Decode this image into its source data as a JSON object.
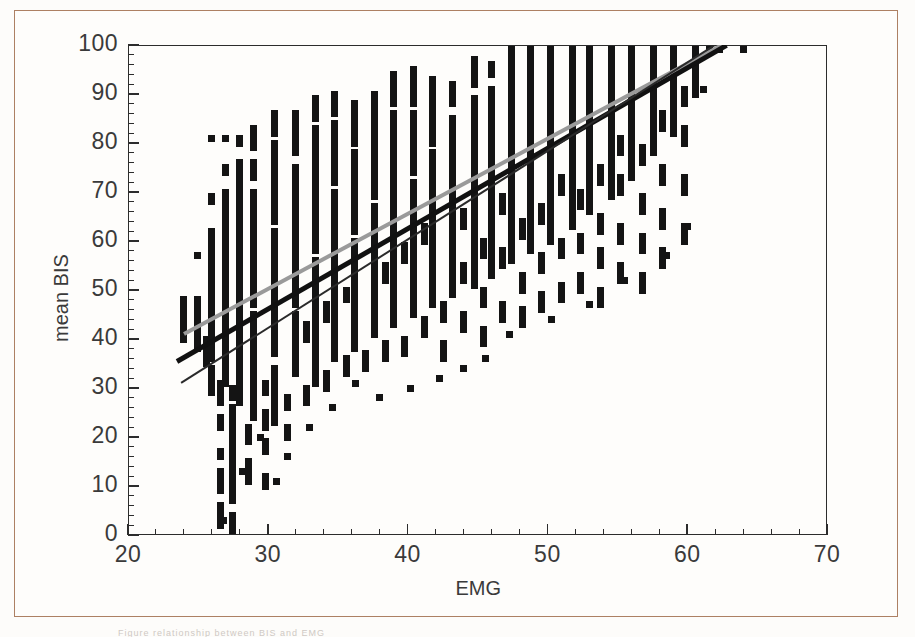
{
  "figure": {
    "frame_color": "#ad8063",
    "background_color": "#fefdfb",
    "caption_fragment": "Figure  relationship    between         BIS          and    EMG"
  },
  "chart_data": {
    "type": "scatter",
    "title": "",
    "xlabel": "EMG",
    "ylabel": "mean BIS",
    "xlim": [
      20,
      70
    ],
    "ylim": [
      0,
      100
    ],
    "x_major_ticks": [
      20,
      30,
      40,
      50,
      60,
      70
    ],
    "y_major_ticks": [
      0,
      10,
      20,
      30,
      40,
      50,
      60,
      70,
      80,
      90,
      100
    ],
    "x_tick_labels": [
      "20",
      "30",
      "40",
      "50",
      "60",
      "70"
    ],
    "y_tick_labels": [
      "0",
      "10",
      "20",
      "30",
      "40",
      "50",
      "60",
      "70",
      "80",
      "90",
      "100"
    ],
    "x_minor_step": 2,
    "y_minor_step": 2,
    "grid": false,
    "legend": "none",
    "marker_color": "#141414",
    "marker_shape": "square",
    "columns": [
      {
        "x": 24.0,
        "bands": [
          [
            40,
            48
          ]
        ]
      },
      {
        "x": 25.0,
        "bands": [
          [
            38,
            48
          ],
          [
            57,
            57
          ]
        ]
      },
      {
        "x": 25.6,
        "bands": [
          [
            35,
            40
          ]
        ]
      },
      {
        "x": 26.0,
        "bands": [
          [
            29,
            34
          ],
          [
            36,
            62
          ],
          [
            68,
            69
          ],
          [
            81,
            81
          ]
        ]
      },
      {
        "x": 26.6,
        "bands": [
          [
            2,
            6
          ],
          [
            9,
            13
          ],
          [
            16,
            17
          ],
          [
            22,
            24
          ],
          [
            27,
            31
          ]
        ]
      },
      {
        "x": 27.0,
        "bands": [
          [
            31,
            70
          ],
          [
            74,
            75
          ],
          [
            81,
            81
          ]
        ]
      },
      {
        "x": 27.5,
        "bands": [
          [
            1,
            4
          ],
          [
            7,
            26
          ],
          [
            28,
            30
          ]
        ]
      },
      {
        "x": 28.0,
        "bands": [
          [
            27,
            76
          ],
          [
            80,
            81
          ]
        ]
      },
      {
        "x": 28.6,
        "bands": [
          [
            11,
            15
          ],
          [
            19,
            22
          ]
        ]
      },
      {
        "x": 29.0,
        "bands": [
          [
            24,
            45
          ],
          [
            47,
            70
          ],
          [
            73,
            76
          ],
          [
            79,
            83
          ]
        ]
      },
      {
        "x": 29.8,
        "bands": [
          [
            10,
            12
          ],
          [
            17,
            19
          ],
          [
            22,
            25
          ],
          [
            29,
            31
          ]
        ]
      },
      {
        "x": 30.5,
        "bands": [
          [
            23,
            34
          ],
          [
            37,
            62
          ],
          [
            64,
            80
          ],
          [
            82,
            86
          ]
        ]
      },
      {
        "x": 31.4,
        "bands": [
          [
            20,
            22
          ],
          [
            26,
            28
          ]
        ]
      },
      {
        "x": 32.0,
        "bands": [
          [
            33,
            45
          ],
          [
            47,
            75
          ],
          [
            78,
            86
          ]
        ]
      },
      {
        "x": 32.8,
        "bands": [
          [
            27,
            30
          ],
          [
            40,
            43
          ]
        ]
      },
      {
        "x": 33.4,
        "bands": [
          [
            31,
            56
          ],
          [
            58,
            83
          ],
          [
            85,
            89
          ]
        ]
      },
      {
        "x": 34.2,
        "bands": [
          [
            30,
            33
          ],
          [
            44,
            47
          ]
        ]
      },
      {
        "x": 34.8,
        "bands": [
          [
            36,
            70
          ],
          [
            72,
            84
          ],
          [
            86,
            90
          ]
        ]
      },
      {
        "x": 35.6,
        "bands": [
          [
            33,
            36
          ],
          [
            48,
            50
          ]
        ]
      },
      {
        "x": 36.2,
        "bands": [
          [
            38,
            60
          ],
          [
            62,
            78
          ],
          [
            80,
            88
          ]
        ]
      },
      {
        "x": 37.0,
        "bands": [
          [
            34,
            37
          ]
        ]
      },
      {
        "x": 37.6,
        "bands": [
          [
            41,
            67
          ],
          [
            69,
            90
          ]
        ]
      },
      {
        "x": 38.4,
        "bands": [
          [
            36,
            39
          ],
          [
            52,
            55
          ]
        ]
      },
      {
        "x": 39.0,
        "bands": [
          [
            43,
            86
          ],
          [
            88,
            94
          ]
        ]
      },
      {
        "x": 39.8,
        "bands": [
          [
            37,
            40
          ],
          [
            56,
            59
          ]
        ]
      },
      {
        "x": 40.4,
        "bands": [
          [
            45,
            72
          ],
          [
            74,
            86
          ],
          [
            88,
            95
          ]
        ]
      },
      {
        "x": 41.2,
        "bands": [
          [
            41,
            44
          ],
          [
            60,
            63
          ]
        ]
      },
      {
        "x": 41.8,
        "bands": [
          [
            47,
            78
          ],
          [
            80,
            93
          ]
        ]
      },
      {
        "x": 42.6,
        "bands": [
          [
            36,
            39
          ],
          [
            44,
            47
          ]
        ]
      },
      {
        "x": 43.2,
        "bands": [
          [
            49,
            85
          ],
          [
            88,
            92
          ]
        ]
      },
      {
        "x": 44.0,
        "bands": [
          [
            42,
            45
          ],
          [
            52,
            55
          ],
          [
            63,
            66
          ]
        ]
      },
      {
        "x": 44.8,
        "bands": [
          [
            51,
            89
          ],
          [
            92,
            97
          ]
        ]
      },
      {
        "x": 45.4,
        "bands": [
          [
            39,
            42
          ],
          [
            47,
            50
          ],
          [
            57,
            60
          ]
        ]
      },
      {
        "x": 46.0,
        "bands": [
          [
            53,
            91
          ],
          [
            94,
            96
          ]
        ]
      },
      {
        "x": 46.8,
        "bands": [
          [
            44,
            47
          ],
          [
            55,
            58
          ],
          [
            66,
            69
          ]
        ]
      },
      {
        "x": 47.4,
        "bands": [
          [
            56,
            99
          ]
        ]
      },
      {
        "x": 48.2,
        "bands": [
          [
            43,
            46
          ],
          [
            50,
            53
          ],
          [
            61,
            64
          ]
        ]
      },
      {
        "x": 48.8,
        "bands": [
          [
            58,
            99
          ]
        ]
      },
      {
        "x": 49.6,
        "bands": [
          [
            46,
            49
          ],
          [
            54,
            57
          ],
          [
            64,
            67
          ]
        ]
      },
      {
        "x": 50.2,
        "bands": [
          [
            60,
            99
          ]
        ]
      },
      {
        "x": 51.0,
        "bands": [
          [
            48,
            51
          ],
          [
            57,
            60
          ],
          [
            70,
            73
          ]
        ]
      },
      {
        "x": 51.8,
        "bands": [
          [
            63,
            99
          ]
        ]
      },
      {
        "x": 52.4,
        "bands": [
          [
            50,
            53
          ],
          [
            58,
            61
          ],
          [
            67,
            70
          ]
        ]
      },
      {
        "x": 53.0,
        "bands": [
          [
            66,
            99
          ]
        ]
      },
      {
        "x": 53.8,
        "bands": [
          [
            47,
            50
          ],
          [
            55,
            58
          ],
          [
            62,
            65
          ],
          [
            72,
            75
          ]
        ]
      },
      {
        "x": 54.6,
        "bands": [
          [
            69,
            99
          ]
        ]
      },
      {
        "x": 55.2,
        "bands": [
          [
            52,
            55
          ],
          [
            60,
            63
          ],
          [
            70,
            73
          ],
          [
            78,
            81
          ]
        ]
      },
      {
        "x": 56.0,
        "bands": [
          [
            73,
            99
          ]
        ]
      },
      {
        "x": 56.8,
        "bands": [
          [
            50,
            53
          ],
          [
            58,
            61
          ],
          [
            66,
            69
          ],
          [
            76,
            79
          ]
        ]
      },
      {
        "x": 57.6,
        "bands": [
          [
            78,
            99
          ]
        ]
      },
      {
        "x": 58.2,
        "bands": [
          [
            55,
            58
          ],
          [
            63,
            66
          ],
          [
            72,
            75
          ],
          [
            83,
            86
          ]
        ]
      },
      {
        "x": 59.0,
        "bands": [
          [
            82,
            99
          ]
        ]
      },
      {
        "x": 59.8,
        "bands": [
          [
            60,
            63
          ],
          [
            70,
            73
          ],
          [
            80,
            83
          ],
          [
            88,
            91
          ]
        ]
      },
      {
        "x": 60.6,
        "bands": [
          [
            90,
            99
          ]
        ]
      }
    ],
    "outlier_points": [
      {
        "x": 64.0,
        "y": 99
      },
      {
        "x": 61.6,
        "y": 99
      },
      {
        "x": 62.3,
        "y": 99
      },
      {
        "x": 61.2,
        "y": 91
      },
      {
        "x": 60.0,
        "y": 63
      },
      {
        "x": 58.5,
        "y": 57
      },
      {
        "x": 55.5,
        "y": 52
      },
      {
        "x": 53.0,
        "y": 47
      },
      {
        "x": 50.3,
        "y": 44
      },
      {
        "x": 47.3,
        "y": 41
      },
      {
        "x": 45.6,
        "y": 36
      },
      {
        "x": 44.0,
        "y": 34
      },
      {
        "x": 42.3,
        "y": 32
      },
      {
        "x": 40.2,
        "y": 30
      },
      {
        "x": 38.0,
        "y": 28
      },
      {
        "x": 36.3,
        "y": 31
      },
      {
        "x": 34.6,
        "y": 26
      },
      {
        "x": 33.0,
        "y": 22
      },
      {
        "x": 31.4,
        "y": 16
      },
      {
        "x": 30.6,
        "y": 11
      },
      {
        "x": 29.5,
        "y": 20
      },
      {
        "x": 28.2,
        "y": 13
      },
      {
        "x": 26.8,
        "y": 3
      }
    ],
    "lines": [
      {
        "name": "upper-gray-line",
        "style": "solid",
        "color": "#9a9a9a",
        "width": 4,
        "x0": 24.0,
        "y0": 41.0,
        "x1": 62.5,
        "y1": 100.0
      },
      {
        "name": "mean-regression-line",
        "style": "solid",
        "color": "#111111",
        "width": 5,
        "x0": 23.5,
        "y0": 35.5,
        "x1": 62.8,
        "y1": 100.0
      },
      {
        "name": "lower-thin-line",
        "style": "solid",
        "color": "#2a2a2a",
        "width": 1.6,
        "x0": 23.8,
        "y0": 31.0,
        "x1": 62.0,
        "y1": 100.0
      }
    ]
  }
}
